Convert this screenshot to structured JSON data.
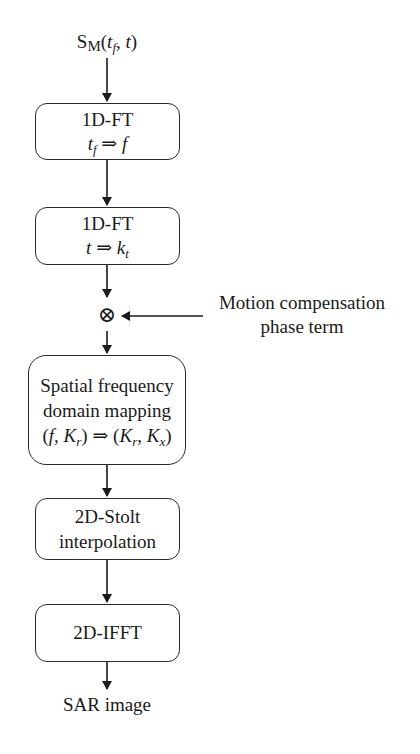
{
  "diagram": {
    "input": {
      "base": "S",
      "sub": "M",
      "args_open": "(",
      "arg1": "t",
      "arg1_sub": "f",
      "sep": ", ",
      "arg2": "t",
      "args_close": ")"
    },
    "step1": {
      "title": "1D-FT",
      "from": "t",
      "from_sub": "f",
      "arrow": " ⇒ ",
      "to": "f"
    },
    "step2": {
      "title": "1D-FT",
      "from": "t",
      "arrow": " ⇒ ",
      "to": "k",
      "to_sub": "t"
    },
    "multiplier": {
      "symbol": "⊗"
    },
    "side_input": {
      "line1": "Motion compensation",
      "line2": "phase term"
    },
    "step3": {
      "line1": "Spatial frequency",
      "line2": "domain mapping",
      "expr_open": "(",
      "f": "f",
      "comma": ", ",
      "K": "K",
      "r_sub": "r",
      "close": ")",
      "arrow": " ⇒ ",
      "out_open": "(",
      "K1": "K",
      "K1_sub": "r",
      "out_comma": ", ",
      "K2": "K",
      "K2_sub": "x",
      "out_close": ")"
    },
    "step4": {
      "line1": "2D-Stolt",
      "line2": "interpolation"
    },
    "step5": {
      "title": "2D-IFFT"
    },
    "output": {
      "label": "SAR image"
    }
  }
}
